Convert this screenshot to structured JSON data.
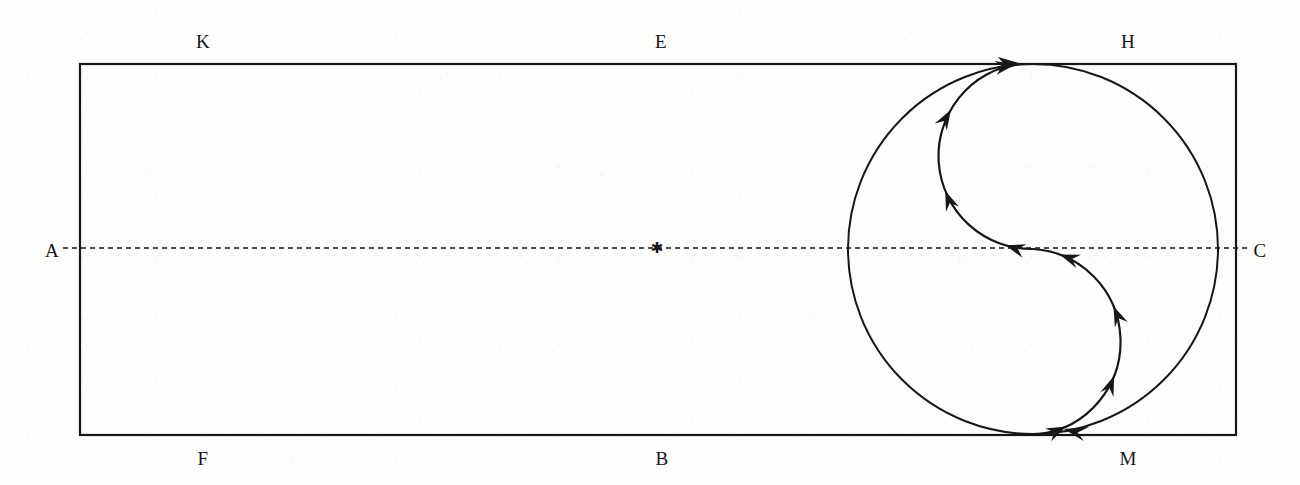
{
  "figure": {
    "stroke_color": "#17171a",
    "background_color": "#fdfdfc"
  },
  "rectangle": {
    "name": "bounding-rectangle",
    "x": 80,
    "y": 64,
    "width": 1156,
    "height": 371,
    "stroke_width": 2.2
  },
  "axis": {
    "name": "horizontal-dashed-axis",
    "y": 248,
    "x_start": 63,
    "x_end": 1247,
    "dash_pattern": "5 4",
    "stroke_width": 1.6
  },
  "center_marker": {
    "name": "asterisk-marker",
    "glyph": "✱",
    "x": 657,
    "y": 248,
    "size": 15
  },
  "circle": {
    "name": "large-circle",
    "cx": 1033,
    "cy": 249,
    "r": 185,
    "stroke_width": 2.0
  },
  "s_curve": {
    "name": "s-shaped-flow-curve",
    "description": "Two tangent semicircular arcs forming an S from the circle bottom up to the circle top",
    "stroke_width": 2.2,
    "upper_arc": {
      "start_x": 1033,
      "start_y": 249,
      "end_x": 1018,
      "end_y": 64,
      "radius": 93,
      "sweep": "counterclockwise-bulge-left"
    },
    "lower_arc": {
      "start_x": 1040,
      "start_y": 434,
      "end_x": 1033,
      "end_y": 249,
      "radius": 93,
      "sweep": "counterclockwise-bulge-right"
    },
    "arrow_count": 8
  },
  "labels": [
    {
      "id": "K",
      "text": "K",
      "x": 203,
      "y": 41,
      "position": "top-left",
      "name": "vertex-label-k"
    },
    {
      "id": "E",
      "text": "E",
      "x": 661,
      "y": 41,
      "position": "top-center",
      "name": "vertex-label-e"
    },
    {
      "id": "H",
      "text": "H",
      "x": 1128,
      "y": 41,
      "position": "top-right",
      "name": "vertex-label-h"
    },
    {
      "id": "A",
      "text": "A",
      "x": 52,
      "y": 250,
      "position": "left-middle",
      "name": "vertex-label-a"
    },
    {
      "id": "C",
      "text": "C",
      "x": 1260,
      "y": 250,
      "position": "right-middle",
      "name": "vertex-label-c"
    },
    {
      "id": "F",
      "text": "F",
      "x": 203,
      "y": 458,
      "position": "bottom-left",
      "name": "vertex-label-f"
    },
    {
      "id": "B",
      "text": "B",
      "x": 662,
      "y": 458,
      "position": "bottom-center",
      "name": "vertex-label-b"
    },
    {
      "id": "M",
      "text": "M",
      "x": 1128,
      "y": 458,
      "position": "bottom-right",
      "name": "vertex-label-m"
    }
  ]
}
